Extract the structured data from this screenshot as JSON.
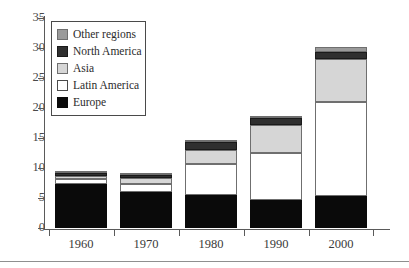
{
  "chart_data": {
    "type": "bar",
    "stacked": true,
    "title": "",
    "subtitle": "",
    "xlabel": "",
    "ylabel": "",
    "categories": [
      "1960",
      "1970",
      "1980",
      "1990",
      "2000"
    ],
    "ylim": [
      0,
      35
    ],
    "yticks": [
      0,
      5,
      10,
      15,
      20,
      25,
      30,
      35
    ],
    "ytick_labels": [
      "0",
      "5",
      "10",
      "15",
      "20",
      "25",
      "30",
      "35"
    ],
    "xtick_labels": [
      "1960",
      "1970",
      "1980",
      "1990",
      "2000"
    ],
    "grid": false,
    "legend_position": "top-left-inside",
    "series": [
      {
        "name": "Europe",
        "color": "#0a0a0a",
        "values": [
          7.3,
          6.0,
          5.5,
          4.7,
          5.3
        ]
      },
      {
        "name": "Latin America",
        "color": "#ffffff",
        "values": [
          0.8,
          1.4,
          5.2,
          7.8,
          15.7
        ]
      },
      {
        "name": "Asia",
        "color": "#d6d6d6",
        "values": [
          0.6,
          0.9,
          2.3,
          4.7,
          7.2
        ]
      },
      {
        "name": "North America",
        "color": "#2f2f2f",
        "values": [
          0.5,
          0.6,
          1.3,
          1.2,
          1.2
        ]
      },
      {
        "name": "Other regions",
        "color": "#9a9a9a",
        "values": [
          0.1,
          0.1,
          0.1,
          0.1,
          0.8
        ]
      }
    ],
    "totals": [
      9.3,
      9.0,
      13.4,
      18.5,
      30.8
    ],
    "legend_order_top_to_bottom": [
      "Other regions",
      "North America",
      "Asia",
      "Latin America",
      "Europe"
    ]
  },
  "legend": {
    "items": [
      {
        "label": "Other regions"
      },
      {
        "label": "North America"
      },
      {
        "label": "Asia"
      },
      {
        "label": "Latin America"
      },
      {
        "label": "Europe"
      }
    ]
  },
  "axes": {
    "y_labels": [
      "35",
      "30",
      "25",
      "20",
      "15",
      "10",
      "5",
      "0"
    ],
    "x_labels": [
      "1960",
      "1970",
      "1980",
      "1990",
      "2000"
    ]
  }
}
